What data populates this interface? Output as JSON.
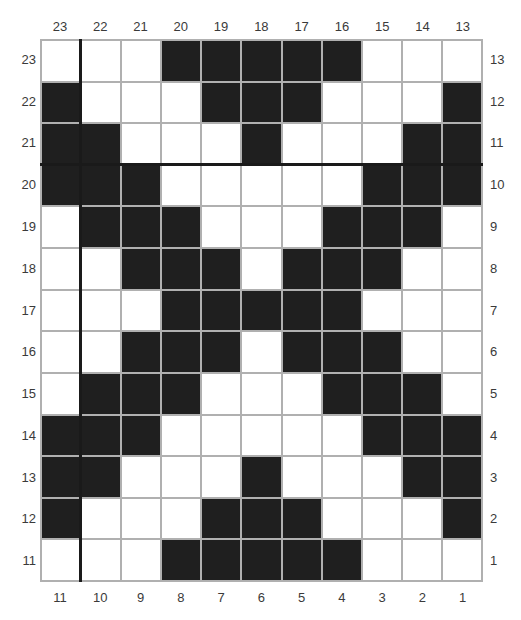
{
  "chart": {
    "title_partial": "",
    "top_labels": [
      "23",
      "22",
      "21",
      "20",
      "19",
      "18",
      "17",
      "16",
      "15",
      "14",
      "13"
    ],
    "bottom_labels": [
      "11",
      "10",
      "9",
      "8",
      "7",
      "6",
      "5",
      "4",
      "3",
      "2",
      "1"
    ],
    "left_labels": [
      "23",
      "22",
      "21",
      "20",
      "19",
      "18",
      "17",
      "16",
      "15",
      "14",
      "13",
      "12",
      "11"
    ],
    "right_labels": [
      "13",
      "12",
      "11",
      "10",
      "9",
      "8",
      "7",
      "6",
      "5",
      "4",
      "3",
      "2",
      "1"
    ],
    "colors": {
      "filled": "#1f1f1f",
      "empty": "#ffffff",
      "gridline": "#b0b0b0",
      "marker_line": "#1a1a1a"
    },
    "rows": [
      [
        0,
        0,
        0,
        1,
        1,
        1,
        1,
        1,
        0,
        0,
        0
      ],
      [
        1,
        0,
        0,
        0,
        1,
        1,
        1,
        0,
        0,
        0,
        1
      ],
      [
        1,
        1,
        0,
        0,
        0,
        1,
        0,
        0,
        0,
        1,
        1
      ],
      [
        1,
        1,
        1,
        0,
        0,
        0,
        0,
        0,
        1,
        1,
        1
      ],
      [
        0,
        1,
        1,
        1,
        0,
        0,
        0,
        1,
        1,
        1,
        0
      ],
      [
        0,
        0,
        1,
        1,
        1,
        0,
        1,
        1,
        1,
        0,
        0
      ],
      [
        0,
        0,
        0,
        1,
        1,
        1,
        1,
        1,
        0,
        0,
        0
      ],
      [
        0,
        0,
        1,
        1,
        1,
        0,
        1,
        1,
        1,
        0,
        0
      ],
      [
        0,
        1,
        1,
        1,
        0,
        0,
        0,
        1,
        1,
        1,
        0
      ],
      [
        1,
        1,
        1,
        0,
        0,
        0,
        0,
        0,
        1,
        1,
        1
      ],
      [
        1,
        1,
        0,
        0,
        0,
        1,
        0,
        0,
        0,
        1,
        1
      ],
      [
        1,
        0,
        0,
        0,
        1,
        1,
        1,
        0,
        0,
        0,
        1
      ],
      [
        0,
        0,
        0,
        1,
        1,
        1,
        1,
        1,
        0,
        0,
        0
      ]
    ],
    "marker_lines": {
      "vertical_after_column_index": 1,
      "horizontal_after_row_index": 3
    }
  }
}
